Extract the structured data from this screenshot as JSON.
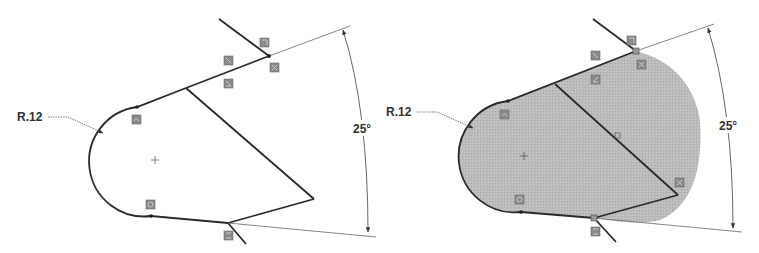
{
  "figure": {
    "left_sketch": {
      "state": "open profile (unfilled)",
      "radius_dimension": {
        "label": "R.12"
      },
      "angle_dimension": {
        "label": "25°"
      },
      "colors": {
        "line": "#2a2a2a",
        "dim_line": "#555555",
        "fill": "none"
      }
    },
    "right_sketch": {
      "state": "closed profile (shaded region)",
      "radius_dimension": {
        "label": "R.12"
      },
      "angle_dimension": {
        "label": "25°"
      },
      "colors": {
        "line": "#2a2a2a",
        "dim_line": "#555555",
        "fill": "#b8b8b8"
      }
    },
    "relation_icon_color": "#8a8a8a",
    "icons": [
      "sketch-relation-icon",
      "center-point-icon",
      "dimension-arrow-icon"
    ]
  }
}
